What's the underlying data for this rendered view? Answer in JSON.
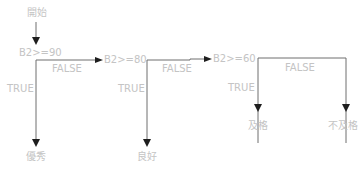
{
  "diagram": {
    "type": "flowchart",
    "start": "開始",
    "end": "結束",
    "conditions": [
      {
        "id": "c1",
        "text": "B2>=90",
        "true_label": "TRUE",
        "false_label": "FALSE"
      },
      {
        "id": "c2",
        "text": "B2>=80",
        "true_label": "TRUE",
        "false_label": "FALSE"
      },
      {
        "id": "c3",
        "text": "B2>=60",
        "true_label": "TRUE",
        "false_label": "FALSE"
      }
    ],
    "outcomes": [
      "優秀",
      "良好",
      "及格",
      "不及格"
    ],
    "colors": {
      "text": "#c4c4c4",
      "line": "#6e6e6e",
      "arrow": "#1e1e1e"
    }
  }
}
